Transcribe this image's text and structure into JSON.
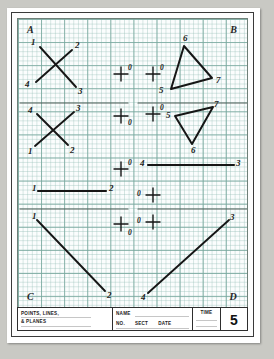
{
  "sheet": {
    "corner_labels": {
      "top_left": "A",
      "top_right": "B",
      "bottom_left": "C",
      "bottom_right": "D"
    }
  },
  "title_block": {
    "drawing_title_line1": "POINTS, LINES,",
    "drawing_title_line2": "& PLANES",
    "name_label": "NAME",
    "no_label": "NO.",
    "sect_label": "SECT",
    "date_label": "DATE",
    "time_label": "TIME",
    "sheet_number": "5"
  },
  "problems": {
    "r1c1": {
      "kind": "crossed-lines",
      "labels": [
        "1",
        "2",
        "4",
        "3"
      ],
      "point_label": "0"
    },
    "r1c2": {
      "kind": "point-mark",
      "point_label": "0"
    },
    "r1c3": {
      "kind": "point-mark",
      "point_label": "0"
    },
    "r1c4": {
      "kind": "triangle",
      "labels": [
        "6",
        "5",
        "7"
      ]
    },
    "r2c1": {
      "kind": "crossed-lines",
      "labels": [
        "4",
        "3",
        "1",
        "2"
      ],
      "point_label": "0"
    },
    "r2c2": {
      "kind": "point-mark",
      "point_label": "0"
    },
    "r2c3": {
      "kind": "point-mark",
      "point_label": "0"
    },
    "r2c4": {
      "kind": "triangle",
      "labels": [
        "5",
        "7",
        "6"
      ]
    },
    "r3c2": {
      "kind": "point-mark",
      "point_label": "0"
    },
    "r3c3": {
      "kind": "horizontal-line",
      "labels": [
        "4",
        "3"
      ]
    },
    "r3c1": {
      "kind": "horizontal-line",
      "labels": [
        "1",
        "2"
      ]
    },
    "r3c4": {
      "kind": "point-mark",
      "point_label": "0"
    },
    "r4c1": {
      "kind": "diagonal-line",
      "labels": [
        "1",
        "2"
      ]
    },
    "r4c2": {
      "kind": "point-mark",
      "point_label": "0"
    },
    "r4c3": {
      "kind": "point-mark",
      "point_label": "0"
    },
    "r4c4": {
      "kind": "diagonal-line",
      "labels": [
        "4",
        "3"
      ]
    }
  },
  "colors": {
    "grid": "#78a89e",
    "ink": "#161616",
    "frame": "#3a3a3a",
    "paper": "#ffffff"
  }
}
